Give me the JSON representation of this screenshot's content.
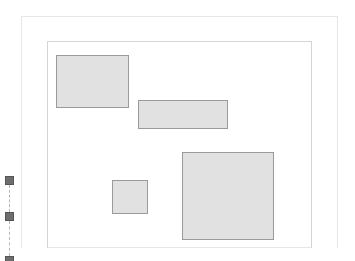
{
  "canvas": {
    "outer_frame": {
      "x": 21,
      "y": 16,
      "w": 317,
      "h": 232
    },
    "inner_frame": {
      "x": 47,
      "y": 41,
      "w": 265,
      "h": 207
    },
    "blocks": [
      {
        "id": "block-top-left",
        "x": 56,
        "y": 55,
        "w": 73,
        "h": 53
      },
      {
        "id": "block-middle-wide",
        "x": 138,
        "y": 100,
        "w": 90,
        "h": 29
      },
      {
        "id": "block-small-square",
        "x": 112,
        "y": 180,
        "w": 36,
        "h": 34
      },
      {
        "id": "block-large",
        "x": 182,
        "y": 152,
        "w": 92,
        "h": 88
      }
    ],
    "colors": {
      "block_fill": "#e1e1e1",
      "block_border": "#9a9a9a",
      "handle": "#6e6e6e"
    }
  },
  "resize_handles": [
    {
      "y": 176
    },
    {
      "y": 212
    },
    {
      "y": 256
    }
  ]
}
